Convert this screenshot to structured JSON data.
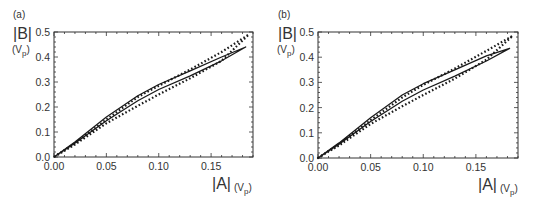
{
  "chart_data": [
    {
      "panel": "(a)",
      "type": "line",
      "title": "",
      "xlabel": "|A|",
      "xunit": "(Vp)",
      "ylabel": "|B|",
      "yunit": "(Vp)",
      "xlim": [
        0,
        0.19
      ],
      "ylim": [
        0,
        0.5
      ],
      "xticks": [
        "0.00",
        "0.05",
        "0.10",
        "0.15"
      ],
      "yticks": [
        "0.0",
        "0.1",
        "0.2",
        "0.3",
        "0.4",
        "0.5"
      ],
      "grid": false,
      "legend": null,
      "series": [
        {
          "name": "solid loop",
          "style": "solid",
          "upper": {
            "x": [
              0,
              0.02,
              0.05,
              0.08,
              0.1,
              0.13,
              0.16,
              0.183
            ],
            "y": [
              0,
              0.06,
              0.16,
              0.245,
              0.29,
              0.345,
              0.4,
              0.44
            ]
          },
          "lower": {
            "x": [
              0,
              0.02,
              0.05,
              0.08,
              0.1,
              0.13,
              0.16,
              0.183
            ],
            "y": [
              0,
              0.055,
              0.145,
              0.225,
              0.27,
              0.325,
              0.385,
              0.43
            ]
          }
        },
        {
          "name": "dotted loop",
          "style": "dotted",
          "upper": {
            "x": [
              0,
              0.02,
              0.05,
              0.08,
              0.1,
              0.13,
              0.16,
              0.186
            ],
            "y": [
              0,
              0.055,
              0.15,
              0.24,
              0.285,
              0.35,
              0.42,
              0.49
            ]
          },
          "lower": {
            "x": [
              0,
              0.02,
              0.05,
              0.08,
              0.1,
              0.13,
              0.16,
              0.186
            ],
            "y": [
              0,
              0.05,
              0.135,
              0.205,
              0.25,
              0.315,
              0.385,
              0.46
            ]
          }
        }
      ]
    },
    {
      "panel": "(b)",
      "type": "line",
      "title": "",
      "xlabel": "|A|",
      "xunit": "(Vp)",
      "ylabel": "|B|",
      "yunit": "(Vp)",
      "xlim": [
        0,
        0.19
      ],
      "ylim": [
        0,
        0.5
      ],
      "xticks": [
        "0.00",
        "0.05",
        "0.10",
        "0.15"
      ],
      "yticks": [
        "0.0",
        "0.1",
        "0.2",
        "0.3",
        "0.4",
        "0.5"
      ],
      "grid": false,
      "legend": null,
      "series": [
        {
          "name": "solid loop",
          "style": "solid",
          "upper": {
            "x": [
              0,
              0.02,
              0.05,
              0.08,
              0.1,
              0.13,
              0.16,
              0.182
            ],
            "y": [
              0,
              0.06,
              0.16,
              0.25,
              0.295,
              0.35,
              0.405,
              0.435
            ]
          },
          "lower": {
            "x": [
              0,
              0.02,
              0.05,
              0.08,
              0.1,
              0.13,
              0.16,
              0.182
            ],
            "y": [
              0,
              0.055,
              0.145,
              0.225,
              0.27,
              0.325,
              0.385,
              0.425
            ]
          }
        },
        {
          "name": "dotted loop",
          "style": "dotted",
          "upper": {
            "x": [
              0,
              0.02,
              0.05,
              0.08,
              0.1,
              0.13,
              0.16,
              0.185
            ],
            "y": [
              0,
              0.055,
              0.15,
              0.24,
              0.29,
              0.355,
              0.425,
              0.485
            ]
          },
          "lower": {
            "x": [
              0,
              0.02,
              0.05,
              0.08,
              0.1,
              0.13,
              0.16,
              0.185
            ],
            "y": [
              0,
              0.05,
              0.135,
              0.205,
              0.25,
              0.315,
              0.39,
              0.455
            ]
          }
        }
      ]
    }
  ],
  "panels": [
    {
      "tag": "(a)",
      "ylabel": "|B|",
      "yunit_main": "(V",
      "yunit_sub": "p",
      "yunit_close": ")",
      "xlabel": "|A|",
      "xunit_main": "(V",
      "xunit_sub": "p",
      "xunit_close": ")"
    },
    {
      "tag": "(b)",
      "ylabel": "|B|",
      "yunit_main": "(V",
      "yunit_sub": "p",
      "yunit_close": ")",
      "xlabel": "|A|",
      "xunit_main": "(V",
      "xunit_sub": "p",
      "xunit_close": ")"
    }
  ],
  "colors": {
    "line": "#1a1a1a",
    "axis": "#333333",
    "background": "#ffffff"
  }
}
